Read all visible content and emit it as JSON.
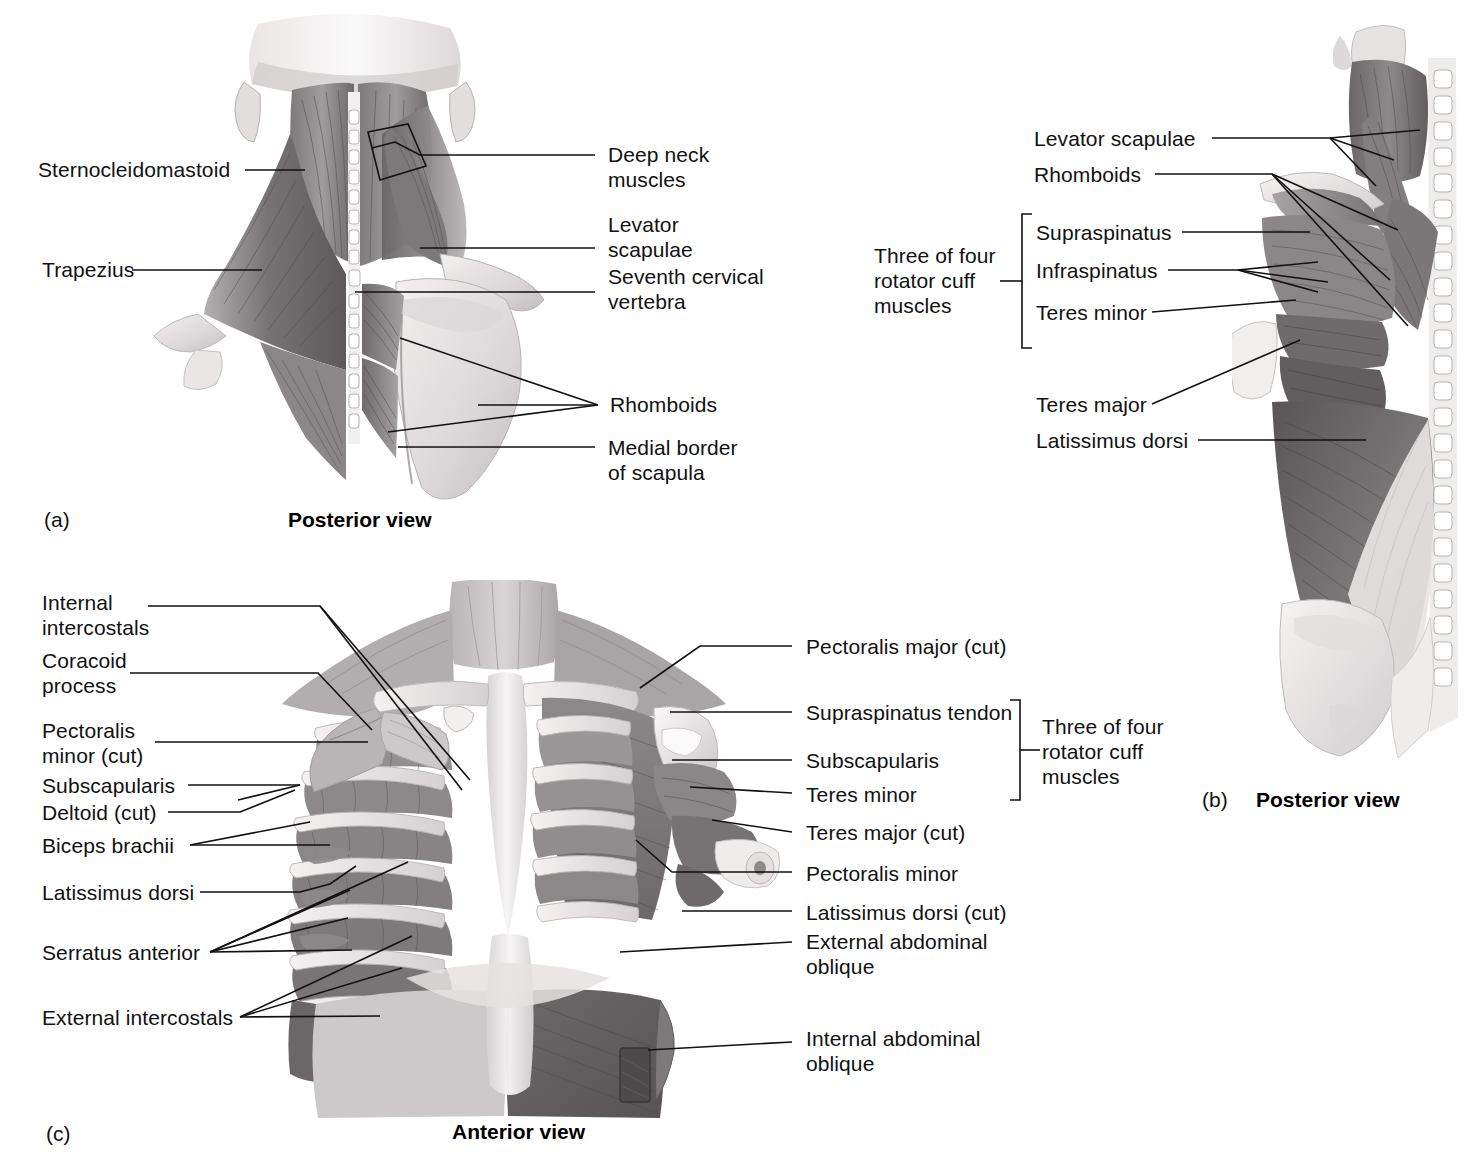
{
  "figure": {
    "panels": [
      {
        "id": "(a)",
        "caption": "Posterior view",
        "labels": [
          "Sternocleidomastoid",
          "Trapezius",
          "Deep neck\nmuscles",
          "Levator\nscapulae",
          "Seventh cervical\nvertebra",
          "Rhomboids",
          "Medial border\nof scapula"
        ]
      },
      {
        "id": "(b)",
        "caption": "Posterior view",
        "labels": [
          "Levator scapulae",
          "Rhomboids",
          "Supraspinatus",
          "Infraspinatus",
          "Teres minor",
          "Teres major",
          "Latissimus dorsi"
        ],
        "bracket_label": "Three of four\nrotator cuff\nmuscles"
      },
      {
        "id": "(c)",
        "caption": "Anterior view",
        "labels_left": [
          "Internal\nintercostals",
          "Coracoid\nprocess",
          "Pectoralis\nminor (cut)",
          "Subscapularis",
          "Deltoid (cut)",
          "Biceps brachii",
          "Latissimus dorsi",
          "Serratus anterior",
          "External intercostals"
        ],
        "labels_right": [
          "Pectoralis major (cut)",
          "Supraspinatus tendon",
          "Subscapularis",
          "Teres minor",
          "Teres major (cut)",
          "Pectoralis minor",
          "Latissimus dorsi (cut)",
          "External abdominal\noblique",
          "Internal abdominal\noblique"
        ],
        "bracket_label": "Three of four\nrotator cuff\nmuscles"
      }
    ]
  },
  "panel_a": {
    "id": "(a)",
    "caption": "Posterior view",
    "l_sternocleidomastoid": "Sternocleidomastoid",
    "l_trapezius": "Trapezius",
    "l_deep_neck": "Deep neck\nmuscles",
    "l_levator_scapulae": "Levator\nscapulae",
    "l_seventh_cervical": "Seventh cervical\nvertebra",
    "l_rhomboids": "Rhomboids",
    "l_medial_border": "Medial border\nof scapula"
  },
  "panel_b": {
    "id": "(b)",
    "caption": "Posterior view",
    "l_levator_scapulae": "Levator scapulae",
    "l_rhomboids": "Rhomboids",
    "l_supraspinatus": "Supraspinatus",
    "l_infraspinatus": "Infraspinatus",
    "l_teres_minor": "Teres minor",
    "l_teres_major": "Teres major",
    "l_latissimus_dorsi": "Latissimus dorsi",
    "l_bracket": "Three of four\nrotator cuff\nmuscles"
  },
  "panel_c": {
    "id": "(c)",
    "caption": "Anterior view",
    "l_internal_intercostals": "Internal\nintercostals",
    "l_coracoid_process": "Coracoid\nprocess",
    "l_pectoralis_minor_cut": "Pectoralis\nminor (cut)",
    "l_subscapularis": "Subscapularis",
    "l_deltoid_cut": "Deltoid (cut)",
    "l_biceps_brachii": "Biceps brachii",
    "l_latissimus_dorsi": "Latissimus dorsi",
    "l_serratus_anterior": "Serratus anterior",
    "l_external_intercostals": "External intercostals",
    "r_pectoralis_major_cut": "Pectoralis major (cut)",
    "r_supraspinatus_tendon": "Supraspinatus tendon",
    "r_subscapularis": "Subscapularis",
    "r_teres_minor": "Teres minor",
    "r_teres_major_cut": "Teres major (cut)",
    "r_pectoralis_minor": "Pectoralis minor",
    "r_latissimus_dorsi_cut": "Latissimus dorsi (cut)",
    "r_external_abdominal_oblique": "External abdominal\noblique",
    "r_internal_abdominal_oblique": "Internal abdominal\noblique",
    "l_bracket": "Three of four\nrotator cuff\nmuscles"
  },
  "colors": {
    "background": "#ffffff",
    "text": "#111111",
    "leader_line": "#111111",
    "muscle_dark": "#555053",
    "muscle_mid": "#8d8a8c",
    "muscle_light": "#c9c6c7",
    "bone_light": "#eeeaea",
    "bone_shadow": "#cfcacb"
  }
}
